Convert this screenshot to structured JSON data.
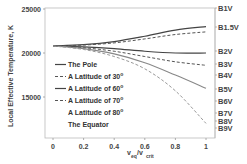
{
  "chart_data": {
    "type": "line",
    "title": "",
    "xlabel": "v_eq/v_crit",
    "ylabel": "Local Effective Temperature, K",
    "xlim": [
      0,
      1
    ],
    "ylim": [
      11500,
      25500
    ],
    "x_ticks": [
      "0",
      "0.2",
      "0.4",
      "0.6",
      "0.8",
      "1"
    ],
    "y_ticks": [
      "15000",
      "20000",
      "25000"
    ],
    "right_axis_labels": [
      "B1V",
      "B1.5V",
      "B2V",
      "B3V",
      "B4V",
      "B5V",
      "B6V",
      "B7V",
      "B8V",
      "B9V"
    ],
    "grid": false,
    "legend_position": "inside-left",
    "x": [
      0,
      0.2,
      0.4,
      0.6,
      0.8,
      1.0
    ],
    "series": [
      {
        "name": "The Pole",
        "style": "solid-dark",
        "values": [
          20800,
          20950,
          21300,
          21900,
          22600,
          23000
        ]
      },
      {
        "name": "A Latitude of 30°",
        "style": "dashed-dark",
        "values": [
          20800,
          20900,
          21150,
          21600,
          22100,
          22400
        ]
      },
      {
        "name": "A Latitude of 60°",
        "style": "solid-dark",
        "values": [
          20800,
          20700,
          20500,
          20200,
          20000,
          20000
        ]
      },
      {
        "name": "A Latitude of 70°",
        "style": "dashed-dark",
        "values": [
          20800,
          20600,
          20200,
          19600,
          19000,
          18600
        ]
      },
      {
        "name": "A Latitude of 80°",
        "style": "solid-gray",
        "values": [
          20800,
          20500,
          19900,
          18900,
          17500,
          16000
        ]
      },
      {
        "name": "The Equator",
        "style": "dashed-gray",
        "values": [
          20800,
          20400,
          19600,
          18200,
          15700,
          12000
        ]
      }
    ]
  },
  "axes": {
    "xlabel_main": "v",
    "xlabel_sub1": "eq",
    "xlabel_slash": "/v",
    "xlabel_sub2": "crit",
    "ylabel": "Local Effective Temperature, K"
  },
  "legend": [
    {
      "label": "The Pole"
    },
    {
      "label": "A Latitude of 30",
      "deg": "o"
    },
    {
      "label": "A Latitude of 60",
      "deg": "o"
    },
    {
      "label": "A Latitude of 70",
      "deg": "o"
    },
    {
      "label": "A Latitude of 80",
      "deg": "o"
    },
    {
      "label": "The Equator"
    }
  ]
}
